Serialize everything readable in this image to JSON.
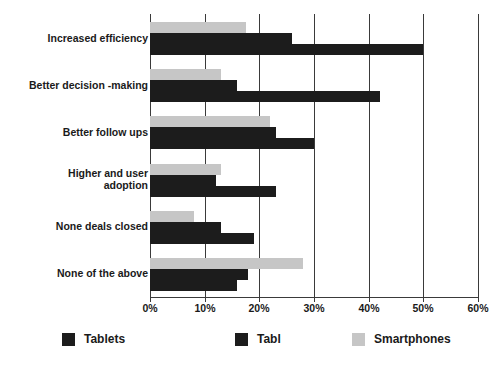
{
  "chart_data": {
    "type": "bar",
    "orientation": "horizontal",
    "title": "",
    "xlabel": "",
    "ylabel": "",
    "xlim": [
      0,
      60
    ],
    "xtick_labels": [
      "0%",
      "10%",
      "20%",
      "30%",
      "40%",
      "50%",
      "60%"
    ],
    "xticks": [
      0,
      10,
      20,
      30,
      40,
      50,
      60
    ],
    "grid": true,
    "legend_position": "bottom",
    "categories": [
      "Increased efficiency",
      "Better decision -making",
      "Better follow ups",
      "Higher and user adoption",
      "None deals closed",
      "None of the above"
    ],
    "series": [
      {
        "name": "Smartphones",
        "color": "#c6c6c6",
        "values": [
          17.5,
          13,
          22,
          13,
          8,
          28
        ]
      },
      {
        "name": "Tabl",
        "color": "#1c1c1c",
        "values": [
          26,
          16,
          23,
          12,
          13,
          18
        ]
      },
      {
        "name": "Tablets",
        "color": "#1c1c1c",
        "values": [
          50,
          42,
          30,
          23,
          19,
          16
        ]
      }
    ]
  },
  "legend": {
    "items": [
      {
        "label": "Tablets",
        "swatch": "dark"
      },
      {
        "label": "Tabl",
        "swatch": "dark2"
      },
      {
        "label": "Smartphones",
        "swatch": "gray"
      }
    ]
  },
  "colors": {
    "series_dark": "#1c1c1c",
    "series_gray": "#c6c6c6",
    "axis": "#3a3a3a",
    "text": "#1a1a1a",
    "background": "#ffffff"
  }
}
